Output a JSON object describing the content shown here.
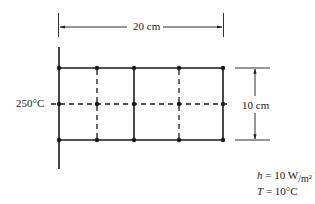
{
  "diagram": {
    "width_label": "20 cm",
    "height_label": "10 cm",
    "wall_temperature": "250°C",
    "h_symbol": "h",
    "h_value": "= 10 W",
    "h_unit_sub": "/m²",
    "h_unit_tail": " °C",
    "T_symbol": "T",
    "T_value": "= 10°C",
    "grid": {
      "columns_x": [
        59,
        97,
        134,
        179,
        223
      ],
      "column_styles": [
        "solid",
        "dashed",
        "solid",
        "dashed",
        "solid"
      ],
      "rows_y": [
        68,
        104,
        140
      ],
      "row_styles": [
        "solid",
        "dashed",
        "solid"
      ]
    },
    "colors": {
      "line": "#1a1a1a",
      "text": "#222222"
    }
  }
}
